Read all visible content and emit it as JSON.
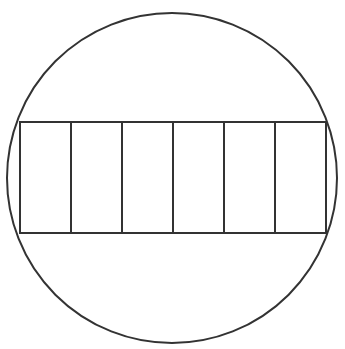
{
  "diagram": {
    "stroke_color": "#333333",
    "background": "#ffffff",
    "circle": {
      "cx": 172,
      "cy": 178,
      "r": 165
    },
    "rectangle": {
      "x": 20,
      "y": 122,
      "width": 306,
      "height": 111
    },
    "sections": 6,
    "dividers_x": [
      71,
      122,
      173,
      224,
      275
    ]
  }
}
